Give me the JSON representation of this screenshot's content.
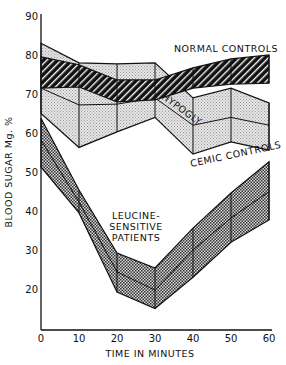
{
  "chart_data": {
    "type": "area",
    "title": "",
    "xlabel": "TIME IN MINUTES",
    "ylabel": "BLOOD SUGAR Mg. %",
    "x": [
      0,
      10,
      20,
      30,
      40,
      50,
      60
    ],
    "xticks": [
      "0",
      "10",
      "20",
      "30",
      "40",
      "50",
      "60"
    ],
    "yticks": [
      "20",
      "30",
      "40",
      "50",
      "60",
      "70",
      "80",
      "90"
    ],
    "ylim": [
      10,
      90
    ],
    "xlim": [
      0,
      60
    ],
    "grid": false,
    "legend": "inline labels",
    "series": [
      {
        "name": "HYPOGLYCEMIC CONTROLS",
        "style": "light-stipple",
        "upper": [
          83,
          78,
          77.7,
          78,
          69,
          71.5,
          67.7
        ],
        "mean": [
          71.5,
          67.2,
          67.4,
          69,
          62,
          64,
          62
        ],
        "lower": [
          65,
          56.3,
          60.3,
          64,
          54.6,
          57.7,
          55.6
        ]
      },
      {
        "name": "NORMAL CONTROLS",
        "style": "black-hatched",
        "upper": [
          79.5,
          77.5,
          73.6,
          73.6,
          76.7,
          79,
          80
        ],
        "lower": [
          71.5,
          71.8,
          68,
          68.5,
          71.5,
          72.5,
          72.8
        ]
      },
      {
        "name": "LEUCINE-SENSITIVE PATIENTS",
        "style": "dark-stipple",
        "upper": [
          63.8,
          45.4,
          29.2,
          25.4,
          35.6,
          44.6,
          52.6
        ],
        "mean": [
          58.2,
          42.3,
          24.4,
          19.7,
          30,
          38.2,
          45
        ],
        "lower": [
          51.3,
          39.5,
          19.2,
          15,
          23,
          32,
          37.7
        ]
      }
    ],
    "annotations": [
      {
        "text": "NORMAL CONTROLS",
        "x": 45,
        "y": 84
      },
      {
        "text": "HYPOGLYCEMIC CONTROLS",
        "x": 38,
        "y": 58,
        "rotated": true
      },
      {
        "text": "LEUCINE-",
        "x": 28,
        "y": 45
      },
      {
        "text": "SENSITIVE",
        "x": 28,
        "y": 42
      },
      {
        "text": "PATIENTS",
        "x": 28,
        "y": 39
      }
    ]
  }
}
